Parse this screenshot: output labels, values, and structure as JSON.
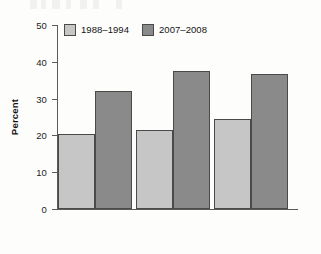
{
  "chart_data": {
    "type": "bar",
    "title": "",
    "subtitle": "",
    "xlabel": "",
    "ylabel": "Percent",
    "ylim": [
      0,
      50
    ],
    "ytick_values": [
      0,
      10,
      20,
      30,
      40,
      50
    ],
    "ytick_labels": [
      "0",
      "10",
      "20",
      "30",
      "40",
      "50"
    ],
    "xtick_labels": [
      "",
      "",
      ""
    ],
    "categories": [
      "Group 1",
      "Group 2",
      "Group 3"
    ],
    "grid": false,
    "legend_position": "top-left inside",
    "series": [
      {
        "name": "1988–1994",
        "color": "#c6c6c6",
        "values": [
          20.4,
          21.4,
          24.5
        ]
      },
      {
        "name": "2007–2008",
        "color": "#8a8a8a",
        "values": [
          32.0,
          37.6,
          36.7
        ]
      }
    ],
    "annotations": []
  },
  "axis": {
    "y_title": "Percent",
    "ticks": [
      {
        "label": "50",
        "value": 50
      },
      {
        "label": "40",
        "value": 40
      },
      {
        "label": "30",
        "value": 30
      },
      {
        "label": "20",
        "value": 20
      },
      {
        "label": "10",
        "value": 10
      },
      {
        "label": "0",
        "value": 0
      }
    ]
  },
  "legend": {
    "items": [
      {
        "label": "1988–1994",
        "color": "#c6c6c6"
      },
      {
        "label": "2007–2008",
        "color": "#8a8a8a"
      }
    ]
  },
  "colors": {
    "series_light": "#c6c6c6",
    "series_dark": "#8a8a8a",
    "axis": "#5a5a58",
    "bar_outline": "#4a4a48",
    "background": "#fdfdfc",
    "text": "#1c1c1c"
  }
}
